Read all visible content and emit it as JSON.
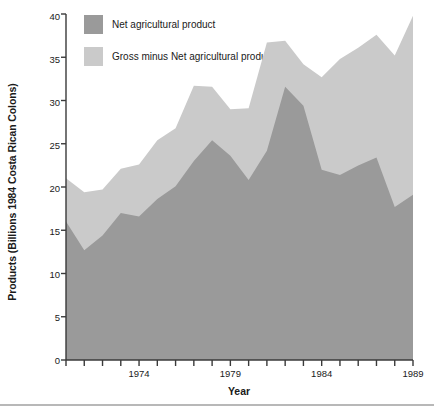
{
  "chart_data": {
    "type": "area",
    "stacked": true,
    "title": "",
    "xlabel": "Year",
    "ylabel": "Products (Billions 1984 Costa Rican Colons)",
    "xlim": [
      1970,
      1989
    ],
    "ylim": [
      0,
      40
    ],
    "grid": false,
    "legend_position": "upper-left-inside",
    "x": [
      1970,
      1971,
      1972,
      1973,
      1974,
      1975,
      1976,
      1977,
      1978,
      1979,
      1980,
      1981,
      1982,
      1983,
      1984,
      1985,
      1986,
      1987,
      1988,
      1989
    ],
    "xtick_labels": [
      "1974",
      "1979",
      "1984",
      "1989"
    ],
    "xtick_values": [
      1974,
      1979,
      1984,
      1989
    ],
    "ytick_labels": [
      "0",
      "5",
      "10",
      "15",
      "20",
      "25",
      "30",
      "35",
      "40"
    ],
    "ytick_values": [
      0,
      5,
      10,
      15,
      20,
      25,
      30,
      35,
      40
    ],
    "series": [
      {
        "name": "Net agricultural product",
        "color": "#9a9a9a",
        "values": [
          16.0,
          12.7,
          14.4,
          17.0,
          16.6,
          18.6,
          20.1,
          23.0,
          25.4,
          23.6,
          20.8,
          24.2,
          31.6,
          29.4,
          22.0,
          21.4,
          22.5,
          23.4,
          17.7,
          19.1
        ]
      },
      {
        "name": "Gross minus Net agricultural product",
        "color": "#cacaca",
        "values": [
          5.0,
          6.7,
          5.3,
          5.1,
          6.0,
          6.8,
          6.7,
          8.7,
          6.2,
          5.4,
          8.3,
          12.5,
          5.3,
          4.8,
          10.7,
          13.4,
          13.6,
          14.2,
          17.5,
          20.7
        ]
      }
    ],
    "totals": [
      21.0,
      19.4,
      19.7,
      22.1,
      22.6,
      25.4,
      26.8,
      31.7,
      31.6,
      29.0,
      29.1,
      36.7,
      36.9,
      34.2,
      32.7,
      34.8,
      36.1,
      37.6,
      35.2,
      39.8
    ]
  },
  "legend": {
    "items": [
      {
        "label": "Net agricultural product",
        "color": "#9a9a9a"
      },
      {
        "label": "Gross minus Net agricultural product",
        "color": "#cacaca"
      }
    ]
  },
  "axes": {
    "y_title": "Products (Billions 1984 Costa Rican Colons)",
    "x_title": "Year"
  }
}
